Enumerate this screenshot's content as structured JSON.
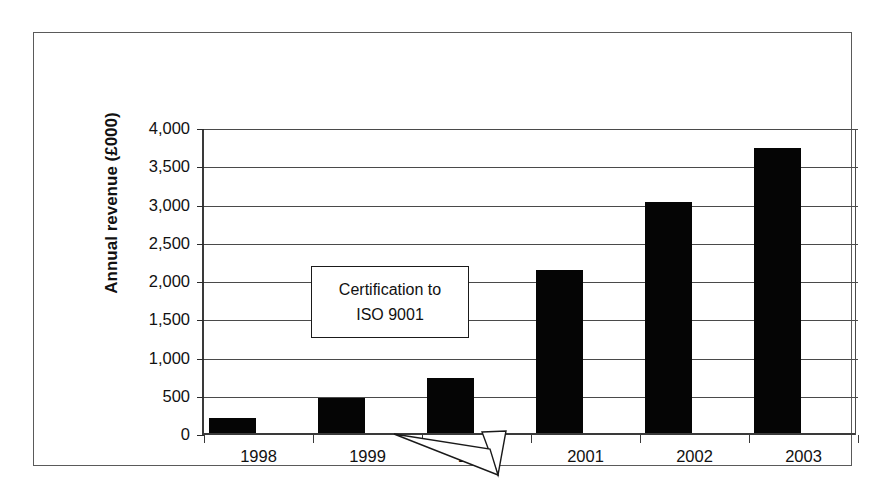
{
  "chart_data": {
    "type": "bar",
    "title": "",
    "xlabel": "",
    "ylabel": "Annual revenue (£000)",
    "categories": [
      "1998",
      "1999",
      "2000",
      "2001",
      "2002",
      "2003"
    ],
    "values": [
      200,
      460,
      720,
      2130,
      3020,
      3730
    ],
    "ylim": [
      0,
      4000
    ],
    "ytick_labels": [
      "0",
      "500",
      "1,000",
      "1,500",
      "2,000",
      "2,500",
      "3,000",
      "3,500",
      "4,000"
    ],
    "ytick_values": [
      0,
      500,
      1000,
      1500,
      2000,
      2500,
      3000,
      3500,
      4000
    ],
    "grid": true,
    "legend": "none",
    "bar_color": "#050505",
    "annotations": [
      {
        "name": "certification-callout",
        "line1": "Certification to",
        "line2": "ISO 9001",
        "points_to_category": "2000"
      }
    ]
  },
  "axis": {
    "y_title": "Annual revenue (£000)"
  }
}
